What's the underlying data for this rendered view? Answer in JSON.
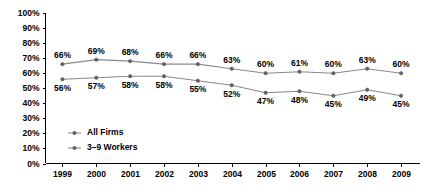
{
  "chart_data": {
    "type": "line",
    "title": "",
    "subtitle": "",
    "xlabel": "",
    "ylabel": "",
    "grid": false,
    "legend_position": "inside-bottom-left",
    "categories": [
      "1999",
      "2000",
      "2001",
      "2002",
      "2003",
      "2004",
      "2005",
      "2006",
      "2007",
      "2008",
      "2009"
    ],
    "ylim": [
      0,
      100
    ],
    "ytick_labels": [
      "100%",
      "90%",
      "80%",
      "70%",
      "60%",
      "50%",
      "40%",
      "30%",
      "20%",
      "10%",
      "0%"
    ],
    "ytick_values": [
      100,
      90,
      80,
      70,
      60,
      50,
      40,
      30,
      20,
      10,
      0
    ],
    "series": [
      {
        "name": "All Firms",
        "values": [
          66,
          69,
          68,
          66,
          66,
          63,
          60,
          61,
          60,
          63,
          60
        ],
        "labels": [
          "66%",
          "69%",
          "68%",
          "66%",
          "66%",
          "63%",
          "60%",
          "61%",
          "60%",
          "63%",
          "60%"
        ],
        "label_position": "above",
        "color": "#8a8a8a"
      },
      {
        "name": "3–9 Workers",
        "values": [
          56,
          57,
          58,
          58,
          55,
          52,
          47,
          48,
          45,
          49,
          45
        ],
        "labels": [
          "56%",
          "57%",
          "58%",
          "58%",
          "55%",
          "52%",
          "47%",
          "48%",
          "45%",
          "49%",
          "45%"
        ],
        "label_position": "below",
        "color": "#8a8a8a"
      }
    ]
  },
  "legend": {
    "entries": [
      {
        "label": "All Firms"
      },
      {
        "label": "3–9 Workers"
      }
    ]
  }
}
